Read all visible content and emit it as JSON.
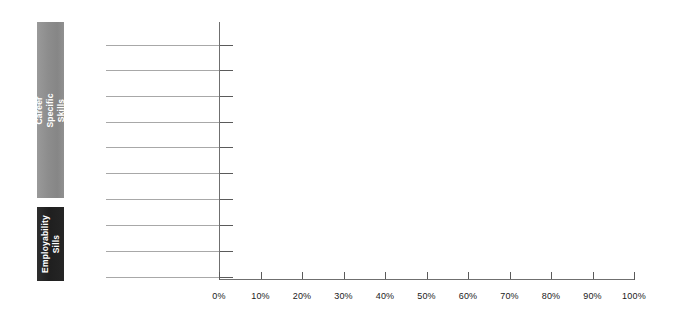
{
  "chart_data": {
    "type": "bar",
    "orientation": "horizontal",
    "title": "",
    "subtitle": "",
    "xlabel": "",
    "ylabel": "",
    "xlim": [
      0,
      100
    ],
    "x_tick_labels": [
      "0%",
      "10%",
      "20%",
      "30%",
      "40%",
      "50%",
      "60%",
      "70%",
      "80%",
      "90%",
      "100%"
    ],
    "x_tick_values": [
      0,
      10,
      20,
      30,
      40,
      50,
      60,
      70,
      80,
      90,
      100
    ],
    "x_axis_unit": "%",
    "grid": false,
    "leader_lines": 10,
    "legend": [],
    "categories": [],
    "values": [],
    "series": [],
    "annotations": [],
    "note": "Plot area is empty - no bars are drawn; only axes, tick marks, category leader lines and the two category group bands are rendered."
  },
  "groups": [
    {
      "id": "career-specific-skills",
      "label": "Career Specific Skills",
      "color": "#8d8d8d",
      "text_color": "#ffffff"
    },
    {
      "id": "employability-sills",
      "label": "Employability\nSills",
      "color": "#1f1f1f",
      "text_color": "#ffffff"
    }
  ],
  "axis": {
    "axis_color": "#6f6f6f",
    "tick_color": "#5a5a5a",
    "leader_line_color": "#a8a8a8",
    "label_color": "#1a1a1a"
  }
}
